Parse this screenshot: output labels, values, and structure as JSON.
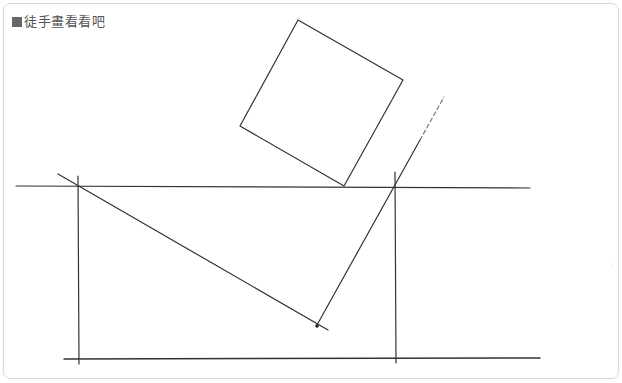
{
  "header": {
    "marker_icon": "square-bullet-icon",
    "title": "徒手畫看看吧"
  },
  "drawing": {
    "stroke_color": "#333333",
    "dash_color": "#777777",
    "frame_border_color": "#d8d8d8",
    "shapes": {
      "rotated_square": "M 298 20 L 403 80 L 344 186 L 240 126 Z",
      "top_horizontal": "M 16 186 L 530 188",
      "bottom_horizontal": "M 64 359 L 540 358",
      "left_vertical": "M 78 176 L 79 364",
      "right_vertical": "M 395 172 L 396 363",
      "diagonal_down": "M 58 174 L 328 330",
      "slanted_line": "M 317 325 L 420 140",
      "dashed_extension": "M 420 140 L 444 97"
    },
    "point": {
      "x": 317,
      "y": 326
    }
  }
}
